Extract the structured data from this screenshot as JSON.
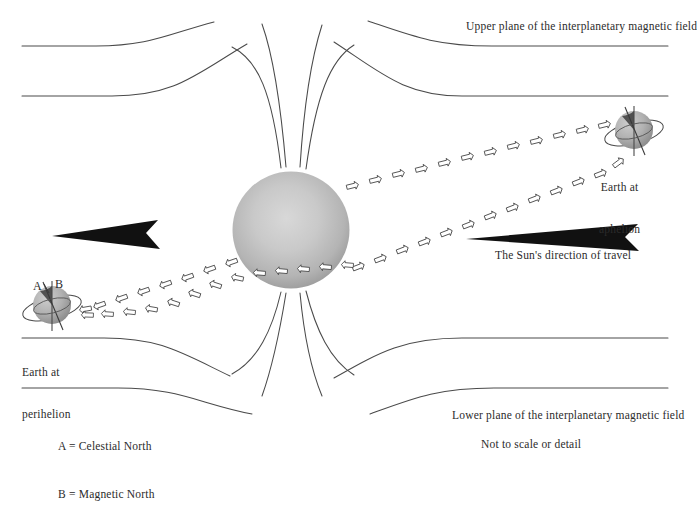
{
  "figure": {
    "title_upper_plane": "Upper plane of the interplanetary magnetic field",
    "title_lower_plane": "Lower plane of the interplanetary magnetic field",
    "sun_direction_label": "The Sun's direction of travel",
    "not_to_scale": "Not to scale or detail",
    "earth_aphelion_line1": "Earth at",
    "earth_aphelion_line2": "aphelion",
    "earth_perihelion_line1": "Earth at",
    "earth_perihelion_line2": "perihelion",
    "axis_label_a": "A",
    "axis_label_b": "B",
    "legend": [
      "A = Celestial North",
      "B = Magnetic North"
    ],
    "colors": {
      "background": "#ffffff",
      "ink": "#2b2b2b",
      "field_line": "#4a4a4a",
      "sun_core": "#cfcfcf",
      "sun_edge": "#9e9e9e",
      "earth_light": "#c4c4c4",
      "earth_dark": "#8a8a8a",
      "arrow_dart": "#111111"
    },
    "icons": {
      "solar_wind": "solar-wind-arrow-icon",
      "travel_dart": "direction-dart-icon"
    }
  }
}
